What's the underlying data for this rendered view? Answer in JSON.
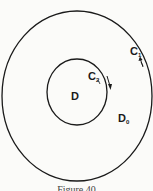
{
  "figure": {
    "caption": "Figure 40",
    "regions": {
      "inner": {
        "label": "D",
        "subscript": ""
      },
      "outer": {
        "label": "D",
        "subscript": "0"
      }
    },
    "curves": {
      "outer": {
        "label": "C",
        "subscript": "1",
        "orientation": "counterclockwise"
      },
      "inner": {
        "label": "C",
        "subscript": "2",
        "orientation": "clockwise"
      }
    },
    "colors": {
      "stroke": "#1a1a1a",
      "background": "#fbfbf9"
    }
  }
}
